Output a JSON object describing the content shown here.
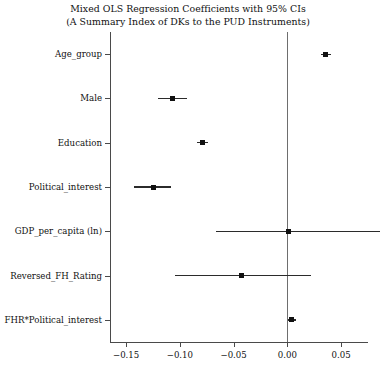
{
  "chart_data": {
    "type": "scatter",
    "title": "Mixed OLS Regression Coefficients with 95% CIs",
    "subtitle": "(A Summary Index of DKs to the PUD Instruments)",
    "xlabel": "",
    "ylabel": "",
    "xlim": [
      -0.165,
      0.075
    ],
    "grid": false,
    "legend": false,
    "zero_reference_line": 0.0,
    "xticks": [
      -0.15,
      -0.1,
      -0.05,
      0.0,
      0.05
    ],
    "xticklabels": [
      "-0.15",
      "-0.10",
      "-0.05",
      "0.00",
      "0.05"
    ],
    "categories": [
      "Age_group",
      "Male",
      "Education",
      "Political_interest",
      "GDP_per_capita (ln)",
      "Reversed_FH_Rating",
      "FHR*Political_interest"
    ],
    "values": [
      0.035,
      -0.107,
      -0.079,
      -0.125,
      0.001,
      -0.043,
      0.004
    ],
    "ci_low": [
      0.031,
      -0.12,
      -0.084,
      -0.143,
      -0.066,
      -0.105,
      0.001
    ],
    "ci_high": [
      0.041,
      -0.093,
      -0.074,
      -0.108,
      0.086,
      0.022,
      0.008
    ],
    "points": [
      {
        "label": "Age_group",
        "estimate": 0.035,
        "ci_low": 0.031,
        "ci_high": 0.041
      },
      {
        "label": "Male",
        "estimate": -0.107,
        "ci_low": -0.12,
        "ci_high": -0.093
      },
      {
        "label": "Education",
        "estimate": -0.079,
        "ci_low": -0.084,
        "ci_high": -0.074
      },
      {
        "label": "Political_interest",
        "estimate": -0.125,
        "ci_low": -0.143,
        "ci_high": -0.108
      },
      {
        "label": "GDP_per_capita (ln)",
        "estimate": 0.001,
        "ci_low": -0.066,
        "ci_high": 0.086
      },
      {
        "label": "Reversed_FH_Rating",
        "estimate": -0.043,
        "ci_low": -0.105,
        "ci_high": 0.022
      },
      {
        "label": "FHR*Political_interest",
        "estimate": 0.004,
        "ci_low": 0.001,
        "ci_high": 0.008
      }
    ],
    "colors": {
      "point": "#111111",
      "ci": "#2b2b2b",
      "axis": "#4a4a4a",
      "zero_line": "#6e6e6e",
      "background": "#ffffff"
    }
  }
}
